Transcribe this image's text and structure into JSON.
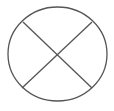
{
  "diagram": {
    "symbol": "circle-with-x",
    "stroke_color": "#555555",
    "background_color": "#ffffff",
    "circle": {
      "cx": 57.5,
      "cy": 54,
      "rx": 49.5,
      "ry": 47
    },
    "lines": [
      {
        "x1": 23,
        "y1": 22,
        "x2": 92,
        "y2": 88
      },
      {
        "x1": 92,
        "y1": 22,
        "x2": 22,
        "y2": 88
      }
    ]
  }
}
